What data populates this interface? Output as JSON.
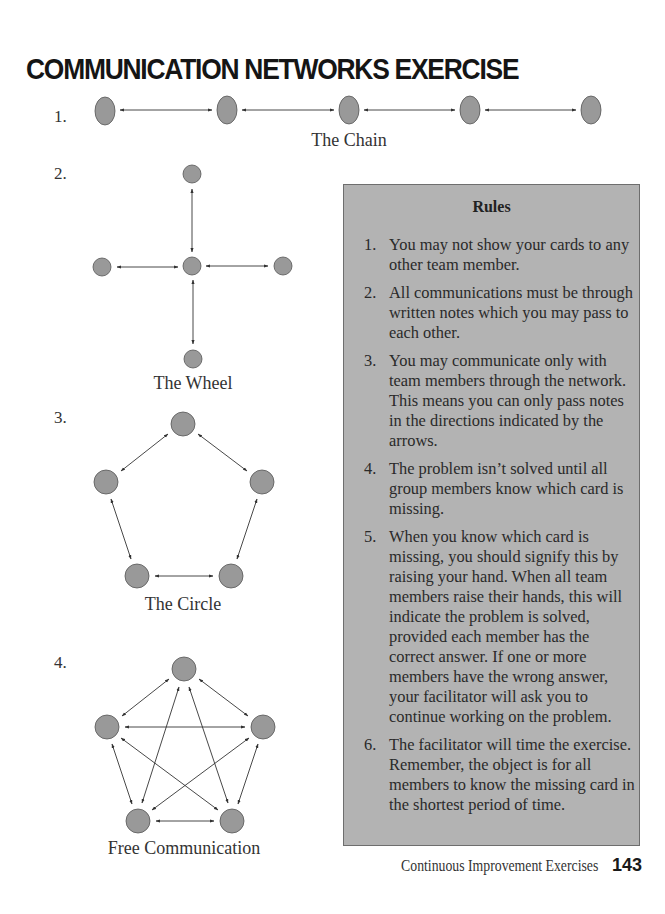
{
  "page": {
    "title": "COMMUNICATION NETWORKS EXERCISE",
    "footer_text": "Continuous Improvement Exercises",
    "page_number": "143"
  },
  "colors": {
    "node_fill": "#999999",
    "node_stroke": "#555555",
    "arrow": "#333333",
    "rules_bg": "#b3b3b3",
    "rules_border": "#6e6e6e"
  },
  "networks": [
    {
      "number": "1.",
      "caption": "The Chain"
    },
    {
      "number": "2.",
      "caption": "The Wheel"
    },
    {
      "number": "3.",
      "caption": "The Circle"
    },
    {
      "number": "4.",
      "caption": "Free Communication"
    }
  ],
  "rules": {
    "heading": "Rules",
    "items": [
      {
        "n": "1.",
        "text": "You may not show your cards to any other team member."
      },
      {
        "n": "2.",
        "text": "All communications must be through written notes which you may pass to each other."
      },
      {
        "n": "3.",
        "text": "You may communicate only with team members through the network. This means you can only pass notes in the directions indicated by the arrows."
      },
      {
        "n": "4.",
        "text": "The problem isn’t solved until all group members know which card is missing."
      },
      {
        "n": "5.",
        "text": "When you know which card is missing, you should signify this by raising your hand. When all team members raise their hands, this will indicate the problem is solved, provided each member has the correct answer. If one or more members have the wrong answer, your facilitator will ask you to continue working on the problem."
      },
      {
        "n": "6.",
        "text": "The facilitator will time the exercise. Remember, the object is for all members to know the missing card in the shortest period of time."
      }
    ]
  }
}
